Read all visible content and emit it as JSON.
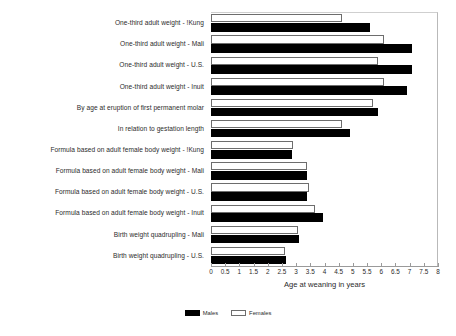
{
  "chart_data": {
    "type": "bar",
    "orientation": "horizontal",
    "title": "",
    "xlabel": "Age at weaning in years",
    "ylabel": "",
    "xlim": [
      0,
      8
    ],
    "xticks": [
      0,
      0.5,
      1,
      1.5,
      2,
      2.5,
      3,
      3.5,
      4,
      4.5,
      5,
      5.5,
      6,
      6.5,
      7,
      7.5,
      8
    ],
    "xtick_labels": [
      "0",
      "0.5",
      "1",
      "1.5",
      "2",
      "2.5",
      "3",
      "3.5",
      "4",
      "4.5",
      "5",
      "5.5",
      "6",
      "6.5",
      "7",
      "7.5",
      "8"
    ],
    "grid": false,
    "legend_position": "bottom",
    "categories": [
      "One-third adult weight - !Kung",
      "One-third adult weight - Mali",
      "One-third adult weight - U.S.",
      "One-third adult weight - Inuit",
      "By age at eruption of first permanent molar",
      "In relation to gestation length",
      "Formula based on adult female body weight - !Kung",
      "Formula based on adult female body weight - Mali",
      "Formula based on adult female body weight - U.S.",
      "Formula based on adult female body weight - Inuit",
      "Birth weight quadrupling - Mali",
      "Birth weight quadrupling - U.S."
    ],
    "series": [
      {
        "name": "Males",
        "color": "#000000",
        "values": [
          5.6,
          7.1,
          7.1,
          6.9,
          5.9,
          4.9,
          2.85,
          3.4,
          3.4,
          3.95,
          3.1,
          2.65
        ]
      },
      {
        "name": "Females",
        "color": "#ffffff",
        "values": [
          4.6,
          6.1,
          5.9,
          6.1,
          5.7,
          4.6,
          2.9,
          3.4,
          3.45,
          3.65,
          3.05,
          2.6
        ]
      }
    ]
  },
  "legend": {
    "males_label": "Males",
    "females_label": "Females"
  }
}
